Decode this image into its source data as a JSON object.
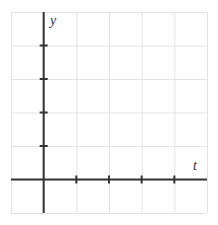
{
  "chart_data": {
    "type": "line",
    "title": "",
    "xlabel": "t",
    "ylabel": "y",
    "x": [],
    "series": [],
    "xlim": [
      -1,
      5
    ],
    "ylim": [
      -1,
      5
    ],
    "x_ticks": [
      1,
      2,
      3,
      4
    ],
    "y_ticks": [
      1,
      2,
      3,
      4
    ],
    "x_tick_labels": [],
    "y_tick_labels": [],
    "grid": true,
    "legend": null
  },
  "axes": {
    "x_label": "t",
    "y_label": "y"
  },
  "colors": {
    "grid": "#e3e3e3",
    "axis": "#333333",
    "background": "#ffffff"
  }
}
